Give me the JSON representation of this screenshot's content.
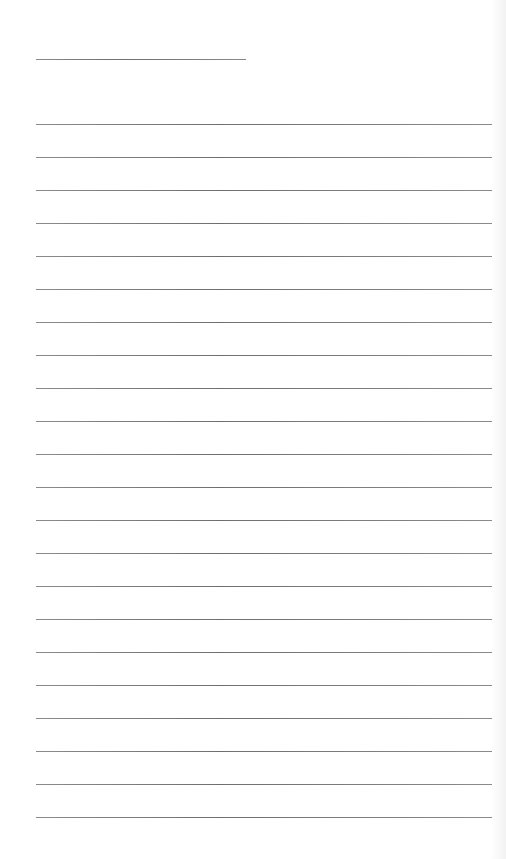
{
  "page": {
    "type": "ruled-paper",
    "background_color": "#ffffff",
    "line_color": "#7a7a7a",
    "title_line": {
      "x": 36,
      "y": 59,
      "width": 210
    },
    "ruled_lines": {
      "x": 36,
      "width": 456,
      "first_y": 124,
      "spacing": 33,
      "count": 22
    }
  }
}
